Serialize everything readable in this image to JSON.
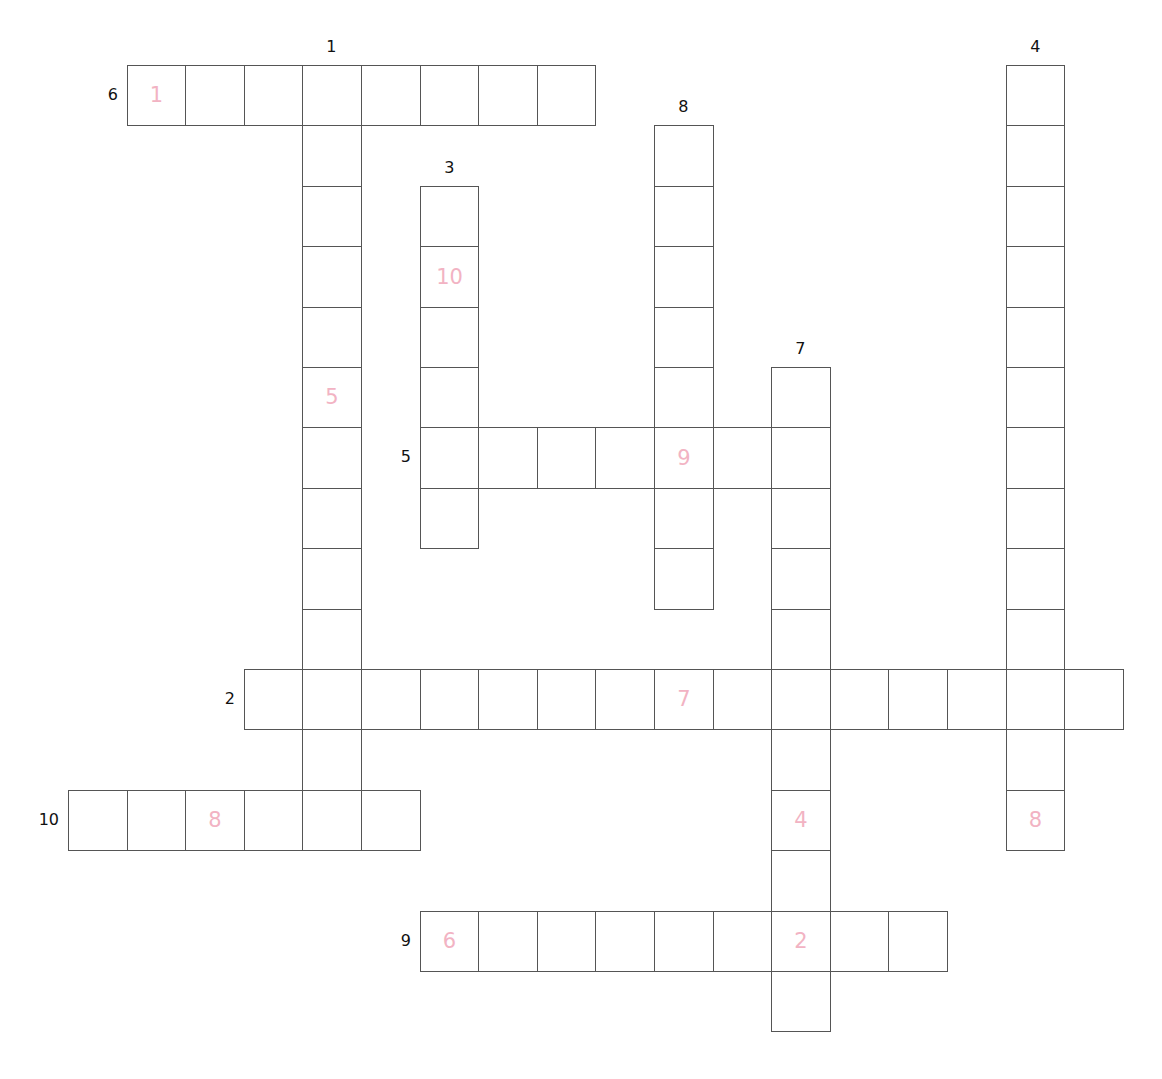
{
  "puzzle": {
    "geometry": {
      "x0": 68,
      "y0": 65,
      "cell_w": 58.6,
      "cell_h": 60.4
    },
    "colors": {
      "line": "#555555",
      "hint": "#f2b3c3",
      "label": "#111111"
    },
    "entries": [
      {
        "number": "6",
        "direction": "across",
        "row": 0,
        "col": 1,
        "length": 8,
        "hints": [
          {
            "offset": 0,
            "value": "1"
          }
        ]
      },
      {
        "number": "1",
        "direction": "down",
        "row": 0,
        "col": 4,
        "length": 13,
        "hints": [
          {
            "offset": 5,
            "value": "5"
          }
        ]
      },
      {
        "number": "3",
        "direction": "down",
        "row": 2,
        "col": 6,
        "length": 6,
        "hints": [
          {
            "offset": 1,
            "value": "10"
          }
        ]
      },
      {
        "number": "8",
        "direction": "down",
        "row": 1,
        "col": 10,
        "length": 8,
        "hints": [
          {
            "offset": 5,
            "value": "9"
          }
        ]
      },
      {
        "number": "4",
        "direction": "down",
        "row": 0,
        "col": 16,
        "length": 13,
        "hints": [
          {
            "offset": 12,
            "value": "8"
          }
        ]
      },
      {
        "number": "7",
        "direction": "down",
        "row": 5,
        "col": 12,
        "length": 11,
        "hints": [
          {
            "offset": 7,
            "value": "4"
          },
          {
            "offset": 9,
            "value": "2"
          }
        ]
      },
      {
        "number": "5",
        "direction": "across",
        "row": 6,
        "col": 6,
        "length": 7,
        "hints": [
          {
            "offset": 4,
            "value": "9"
          }
        ]
      },
      {
        "number": "2",
        "direction": "across",
        "row": 10,
        "col": 3,
        "length": 15,
        "hints": [
          {
            "offset": 7,
            "value": "7"
          }
        ]
      },
      {
        "number": "10",
        "direction": "across",
        "row": 12,
        "col": 0,
        "length": 6,
        "hints": [
          {
            "offset": 2,
            "value": "8"
          }
        ]
      },
      {
        "number": "9",
        "direction": "across",
        "row": 14,
        "col": 6,
        "length": 9,
        "hints": [
          {
            "offset": 0,
            "value": "6"
          },
          {
            "offset": 6,
            "value": "2"
          }
        ]
      }
    ]
  }
}
